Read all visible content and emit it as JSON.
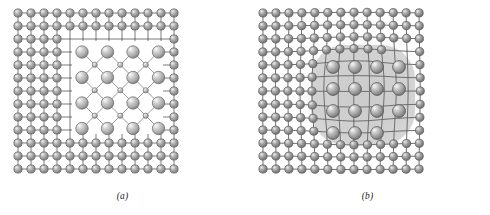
{
  "figure": {
    "type": "crystal-lattice-schematic",
    "background_color": "#ffffff",
    "panels": [
      {
        "id": "a",
        "caption": "(a)",
        "description": "Square host lattice with a rectangular region removed and replaced by a second-phase particle having a larger lattice parameter; particle lattice does not match host lattice across the interface (incoherent interface).",
        "host_lattice": {
          "columns": 13,
          "rows": 13,
          "pitch_px": 13.0,
          "origin_x": 18,
          "origin_y": 13,
          "atom_radius_px": 4.1,
          "atom_color": "#9a9a9a",
          "atom_highlight_color": "#e8e8e8",
          "atom_edge_color": "#5d5d5d",
          "bond_color": "#7a7a7a",
          "bond_width_px": 1.0
        },
        "cutout": {
          "shape": "rectangle",
          "x": 72,
          "y": 41,
          "width": 91,
          "height": 93,
          "fill": "#ffffff"
        },
        "particle": {
          "large_atoms": {
            "columns": 4,
            "rows": 4,
            "pitch_px": 25.5,
            "origin_x": 82,
            "origin_y": 52,
            "radius_px": 6.2,
            "color": "#b9b9b9",
            "highlight_color": "#f2f2f2",
            "edge_color": "#6e6e6e"
          },
          "small_atoms": {
            "columns": 3,
            "rows": 3,
            "pitch_px": 25.5,
            "origin_x": 94.75,
            "origin_y": 64.75,
            "radius_px": 2.6,
            "color": "#c9c9c9",
            "highlight_color": "#f5f5f5",
            "edge_color": "#777777"
          },
          "bond_color": "#8a8a8a",
          "bond_width_px": 0.85
        }
      },
      {
        "id": "b",
        "caption": "(b)",
        "description": "Continuous host lattice elastically strained around a coherent second-phase particle; lattice planes bend and remain continuous through the particle, which is shown as a translucent grey rounded region containing enlarged atoms.",
        "host_lattice": {
          "columns": 13,
          "rows": 13,
          "pitch_px": 13.0,
          "origin_x": 18,
          "origin_y": 13,
          "atom_radius_px": 4.1,
          "atom_color": "#9a9a9a",
          "atom_highlight_color": "#e8e8e8",
          "atom_edge_color": "#5d5d5d",
          "bond_color": "#6f6f6f",
          "bond_width_px": 1.0
        },
        "strain_field": {
          "center_x": 110,
          "center_y": 89,
          "radius_px": 56,
          "max_displacement_px": 5.6,
          "falloff": "gaussian"
        },
        "precipitate_overlay": {
          "shape": "rounded-rectangle",
          "x": 66,
          "y": 45,
          "width": 104,
          "height": 100,
          "corner_radius_px": 34,
          "fill": "#b5b5b5",
          "opacity": 0.52,
          "halo_fill": "#d8d8d8",
          "halo_opacity": 0.45
        },
        "enlarged_atoms": {
          "columns": 5,
          "rows": 5,
          "pitch_px": 22.0,
          "origin_x": 66,
          "origin_y": 45,
          "radius_px": 6.4,
          "color": "#a5a5a5",
          "highlight_color": "#ededed",
          "edge_color": "#4f4f4f"
        }
      }
    ]
  }
}
